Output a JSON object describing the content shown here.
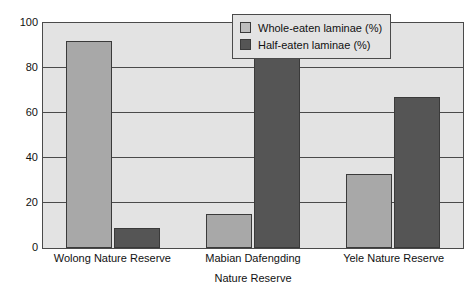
{
  "chart_data": {
    "type": "bar",
    "title": "",
    "categories": [
      "Wolong Nature Reserve",
      "Mabian Dafengding",
      "Yele Nature Reserve"
    ],
    "series": [
      {
        "name": "Whole-eaten laminae (%)",
        "values": [
          92,
          15,
          33
        ],
        "color": "#a8a8a8"
      },
      {
        "name": "Half-eaten laminae (%)",
        "values": [
          9,
          86,
          67
        ],
        "color": "#555555"
      }
    ],
    "xlabel": "Nature Reserve",
    "ylabel": "",
    "ylim": [
      0,
      100
    ],
    "yticks": [
      0,
      20,
      40,
      60,
      80,
      100
    ],
    "ytick_labels": [
      "0",
      "20",
      "40",
      "60",
      "80",
      "100"
    ],
    "grid": true,
    "legend_position": "top-right",
    "plot_background": "#e3e3e3",
    "axis_color": "#4a4a4a"
  },
  "legend": {
    "items": [
      {
        "label": "Whole-eaten laminae (%)"
      },
      {
        "label": "Half-eaten laminae (%)"
      }
    ]
  },
  "axes": {
    "x_title": "Nature Reserve",
    "y_ticks": [
      "100",
      "80",
      "60",
      "40",
      "20",
      "0"
    ],
    "x_categories": [
      "Wolong Nature Reserve",
      "Mabian Dafengding",
      "Yele Nature Reserve"
    ]
  }
}
